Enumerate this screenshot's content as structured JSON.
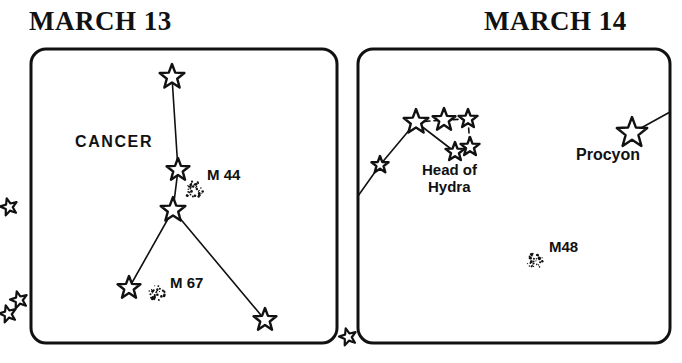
{
  "figure": {
    "type": "star-chart",
    "background_color": "#ffffff",
    "ink_color": "#111111",
    "panels": [
      {
        "id": "march-13",
        "title": "MARCH 13",
        "title_pos": [
          29,
          6
        ],
        "frame": {
          "x": 31,
          "y": 49,
          "width": 306,
          "height": 294,
          "radius": 15,
          "stroke": 3
        },
        "constellation_labels": [
          {
            "text": "CANCER",
            "x": 75,
            "y": 147,
            "size": 16,
            "letter_spacing": 1.6
          }
        ],
        "stars": [
          {
            "name": "cancer-star-top",
            "x": 172,
            "y": 77,
            "size": 13
          },
          {
            "name": "cancer-star-middle",
            "x": 178,
            "y": 170,
            "size": 12
          },
          {
            "name": "cancer-star-junction",
            "x": 173,
            "y": 210,
            "size": 13
          },
          {
            "name": "cancer-star-lower-left",
            "x": 129,
            "y": 288,
            "size": 12
          },
          {
            "name": "cancer-star-lower-right",
            "x": 265,
            "y": 320,
            "size": 12
          }
        ],
        "lines": [
          {
            "from": [
              172,
              77
            ],
            "to": [
              178,
              170
            ]
          },
          {
            "from": [
              178,
              170
            ],
            "to": [
              173,
              210
            ]
          },
          {
            "from": [
              173,
              210
            ],
            "to": [
              129,
              288
            ]
          },
          {
            "from": [
              173,
              210
            ],
            "to": [
              265,
              320
            ]
          }
        ],
        "clusters": [
          {
            "name": "M44",
            "x": 194,
            "y": 190,
            "radius": 9,
            "label": "M 44",
            "label_x": 207,
            "label_y": 180,
            "label_size": 15
          },
          {
            "name": "M67",
            "x": 157,
            "y": 293,
            "radius": 8,
            "label": "M 67",
            "label_x": 170,
            "label_y": 288,
            "label_size": 15
          }
        ]
      },
      {
        "id": "march-14",
        "title": "MARCH 14",
        "title_pos": [
          484,
          6
        ],
        "frame": {
          "x": 358,
          "y": 49,
          "width": 312,
          "height": 294,
          "radius": 15,
          "stroke": 3
        },
        "constellation_labels": [
          {
            "text": "Head of",
            "x": 422,
            "y": 175,
            "size": 15
          },
          {
            "text": "Hydra",
            "x": 428,
            "y": 192,
            "size": 15
          },
          {
            "text": "Procyon",
            "x": 576,
            "y": 160,
            "size": 16
          }
        ],
        "stars": [
          {
            "name": "hydra-star-outer",
            "x": 380,
            "y": 165,
            "size": 9
          },
          {
            "name": "hydra-star-west",
            "x": 416,
            "y": 122,
            "size": 13
          },
          {
            "name": "hydra-star-center",
            "x": 444,
            "y": 120,
            "size": 12
          },
          {
            "name": "hydra-star-east",
            "x": 468,
            "y": 119,
            "size": 10
          },
          {
            "name": "hydra-star-south-east",
            "x": 470,
            "y": 147,
            "size": 10
          },
          {
            "name": "hydra-star-south-west",
            "x": 455,
            "y": 152,
            "size": 10
          },
          {
            "name": "procyon-star",
            "x": 632,
            "y": 133,
            "size": 16
          }
        ],
        "lines": [
          {
            "from": [
              358,
              196
            ],
            "to": [
              380,
              165
            ]
          },
          {
            "from": [
              380,
              165
            ],
            "to": [
              416,
              122
            ]
          },
          {
            "from": [
              416,
              122
            ],
            "to": [
              444,
              120
            ],
            "dashed": true
          },
          {
            "from": [
              444,
              120
            ],
            "to": [
              468,
              119
            ],
            "dashed": true
          },
          {
            "from": [
              468,
              119
            ],
            "to": [
              470,
              147
            ],
            "dashed": true
          },
          {
            "from": [
              470,
              147
            ],
            "to": [
              455,
              152
            ],
            "dashed": true
          },
          {
            "from": [
              416,
              122
            ],
            "to": [
              455,
              152
            ]
          },
          {
            "from": [
              632,
              133
            ],
            "to": [
              670,
              112
            ]
          }
        ],
        "clusters": [
          {
            "name": "M48",
            "x": 535,
            "y": 261,
            "radius": 8,
            "label": "M48",
            "label_x": 549,
            "label_y": 252,
            "label_size": 15
          }
        ]
      }
    ],
    "margin_stars": [
      {
        "name": "margin-star-upper-left",
        "x": 9,
        "y": 207,
        "size": 9
      },
      {
        "name": "margin-star-lower-left-a",
        "x": 19,
        "y": 300,
        "size": 9
      },
      {
        "name": "margin-star-lower-left-b",
        "x": 8,
        "y": 314,
        "size": 9
      },
      {
        "name": "margin-star-between",
        "x": 348,
        "y": 337,
        "size": 9
      }
    ]
  }
}
